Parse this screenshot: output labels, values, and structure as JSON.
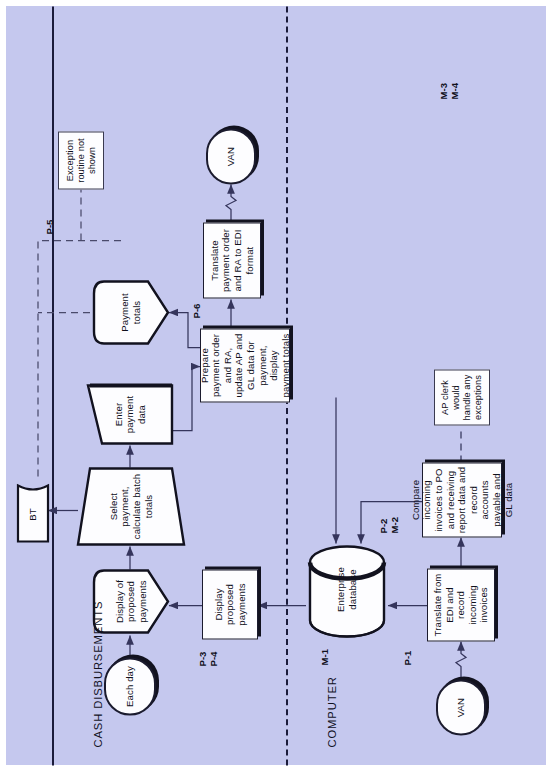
{
  "diagram": {
    "background_color": "#c5c8ee",
    "node_fill": "#fdfdff",
    "line_color": "#1b1b3a",
    "lanes": [
      {
        "id": "cash",
        "label": "CASH DISBURSEMENTS"
      },
      {
        "id": "computer",
        "label": "COMPUTER"
      }
    ],
    "nodes": {
      "van_in": {
        "label": "VAN",
        "shape": "terminator"
      },
      "translate_edi": {
        "label": "Translate from EDI and record incoming invoices",
        "shape": "process"
      },
      "compare_invoices": {
        "label": "Compare incoming invoices to PO and receiving report data and record accounts payable and GL data",
        "shape": "process"
      },
      "ap_clerk_note": {
        "label": "AP clerk would handle any exceptions",
        "shape": "annotation"
      },
      "enterprise_db": {
        "label": "Enterprise database",
        "shape": "database"
      },
      "display_proposed": {
        "label": "Display proposed payments",
        "shape": "process"
      },
      "prepare_payment": {
        "label": "Prepare payment order and RA, update AP and GL data for payment, display payment totals",
        "shape": "process"
      },
      "translate_to_edi": {
        "label": "Translate payment order and RA to EDI format",
        "shape": "process"
      },
      "van_out": {
        "label": "VAN",
        "shape": "terminator"
      },
      "each_day": {
        "label": "Each day",
        "shape": "terminator"
      },
      "display_of_proposed": {
        "label": "Display of proposed payments",
        "shape": "display"
      },
      "select_payment": {
        "label": "Select payment, calculate batch totals",
        "shape": "manual-operation"
      },
      "enter_payment": {
        "label": "Enter payment data",
        "shape": "manual-input"
      },
      "payment_totals": {
        "label": "Payment totals",
        "shape": "display"
      },
      "bt_document": {
        "label": "BT",
        "shape": "document"
      },
      "exception_note": {
        "label": "Exception routine not shown",
        "shape": "annotation"
      }
    },
    "refs": {
      "p1": "P-1",
      "p2": "P-2",
      "m2": "M-2",
      "m1": "M-1",
      "p3": "P-3",
      "p4": "P-4",
      "p5": "P-5",
      "p6": "P-6",
      "m3": "M-3",
      "m4": "M-4"
    }
  }
}
